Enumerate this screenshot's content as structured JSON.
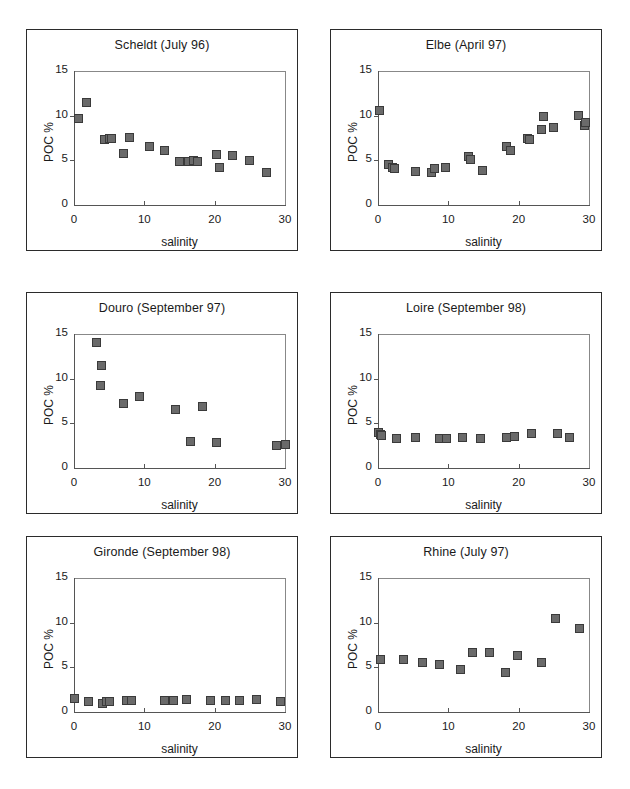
{
  "figure": {
    "width": 630,
    "height": 789,
    "background": "#ffffff",
    "marker_fill": "#6a6a6a",
    "marker_edge": "#3a3a3a",
    "axis_color": "#555555",
    "panel_border": "#2b2b2b"
  },
  "chart_data": [
    {
      "type": "scatter",
      "title": "Scheldt (July 96)",
      "xlabel": "salinity",
      "ylabel": "POC %",
      "xlim": [
        0,
        30
      ],
      "ylim": [
        0,
        15
      ],
      "xticks": [
        0,
        10,
        20,
        30
      ],
      "yticks": [
        0,
        5,
        10,
        15
      ],
      "grid": false,
      "legend": "none",
      "points": [
        {
          "x": 0.6,
          "y": 9.7
        },
        {
          "x": 1.8,
          "y": 11.5
        },
        {
          "x": 4.4,
          "y": 7.3
        },
        {
          "x": 5.0,
          "y": 7.4
        },
        {
          "x": 5.3,
          "y": 7.5
        },
        {
          "x": 7.0,
          "y": 5.8
        },
        {
          "x": 7.9,
          "y": 7.6
        },
        {
          "x": 10.7,
          "y": 6.5
        },
        {
          "x": 12.8,
          "y": 6.1
        },
        {
          "x": 15.0,
          "y": 4.9
        },
        {
          "x": 16.3,
          "y": 4.9
        },
        {
          "x": 17.0,
          "y": 5.0
        },
        {
          "x": 17.6,
          "y": 4.9
        },
        {
          "x": 20.3,
          "y": 5.7
        },
        {
          "x": 20.7,
          "y": 4.2
        },
        {
          "x": 22.5,
          "y": 5.5
        },
        {
          "x": 25.0,
          "y": 5.0
        },
        {
          "x": 27.4,
          "y": 3.6
        }
      ]
    },
    {
      "type": "scatter",
      "title": "Elbe (April 97)",
      "xlabel": "salinity",
      "ylabel": "POC %",
      "xlim": [
        0,
        30
      ],
      "ylim": [
        0,
        15
      ],
      "xticks": [
        0,
        10,
        20,
        30
      ],
      "yticks": [
        0,
        5,
        10,
        15
      ],
      "grid": false,
      "legend": "none",
      "points": [
        {
          "x": 0.2,
          "y": 10.6
        },
        {
          "x": 1.5,
          "y": 4.5
        },
        {
          "x": 2.0,
          "y": 4.2
        },
        {
          "x": 2.4,
          "y": 4.1
        },
        {
          "x": 5.4,
          "y": 3.8
        },
        {
          "x": 7.6,
          "y": 3.6
        },
        {
          "x": 8.0,
          "y": 4.1
        },
        {
          "x": 9.6,
          "y": 4.2
        },
        {
          "x": 12.8,
          "y": 5.4
        },
        {
          "x": 13.1,
          "y": 5.1
        },
        {
          "x": 14.9,
          "y": 3.9
        },
        {
          "x": 18.3,
          "y": 6.6
        },
        {
          "x": 18.9,
          "y": 6.1
        },
        {
          "x": 21.3,
          "y": 7.5
        },
        {
          "x": 21.6,
          "y": 7.3
        },
        {
          "x": 23.3,
          "y": 8.4
        },
        {
          "x": 23.6,
          "y": 9.9
        },
        {
          "x": 25.0,
          "y": 8.7
        },
        {
          "x": 28.5,
          "y": 10.0
        },
        {
          "x": 29.3,
          "y": 8.9
        },
        {
          "x": 29.5,
          "y": 9.2
        }
      ]
    },
    {
      "type": "scatter",
      "title": "Douro (September 97)",
      "xlabel": "salinity",
      "ylabel": "POC %",
      "xlim": [
        0,
        30
      ],
      "ylim": [
        0,
        15
      ],
      "xticks": [
        0,
        10,
        20,
        30
      ],
      "yticks": [
        0,
        5,
        10,
        15
      ],
      "grid": false,
      "legend": "none",
      "points": [
        {
          "x": 3.2,
          "y": 14.0
        },
        {
          "x": 3.9,
          "y": 11.5
        },
        {
          "x": 3.8,
          "y": 9.2
        },
        {
          "x": 7.0,
          "y": 7.2
        },
        {
          "x": 9.3,
          "y": 8.0
        },
        {
          "x": 14.5,
          "y": 6.6
        },
        {
          "x": 16.6,
          "y": 3.0
        },
        {
          "x": 18.3,
          "y": 6.9
        },
        {
          "x": 20.3,
          "y": 2.9
        },
        {
          "x": 28.8,
          "y": 2.5
        },
        {
          "x": 30.0,
          "y": 2.6
        }
      ]
    },
    {
      "type": "scatter",
      "title": "Loire (September 98)",
      "xlabel": "salinity",
      "ylabel": "POC %",
      "xlim": [
        0,
        30
      ],
      "ylim": [
        0,
        15
      ],
      "xticks": [
        0,
        10,
        20,
        30
      ],
      "yticks": [
        0,
        5,
        10,
        15
      ],
      "grid": false,
      "legend": "none",
      "points": [
        {
          "x": 0.0,
          "y": 4.0
        },
        {
          "x": 0.3,
          "y": 3.7
        },
        {
          "x": 0.5,
          "y": 3.6
        },
        {
          "x": 2.6,
          "y": 3.3
        },
        {
          "x": 5.4,
          "y": 3.4
        },
        {
          "x": 8.8,
          "y": 3.3
        },
        {
          "x": 9.8,
          "y": 3.3
        },
        {
          "x": 12.0,
          "y": 3.4
        },
        {
          "x": 14.6,
          "y": 3.3
        },
        {
          "x": 18.3,
          "y": 3.4
        },
        {
          "x": 19.4,
          "y": 3.5
        },
        {
          "x": 21.8,
          "y": 3.9
        },
        {
          "x": 25.5,
          "y": 3.9
        },
        {
          "x": 27.2,
          "y": 3.4
        }
      ]
    },
    {
      "type": "scatter",
      "title": "Gironde (September 98)",
      "xlabel": "salinity",
      "ylabel": "POC %",
      "xlim": [
        0,
        30
      ],
      "ylim": [
        0,
        15
      ],
      "xticks": [
        0,
        10,
        20,
        30
      ],
      "yticks": [
        0,
        5,
        10,
        15
      ],
      "grid": false,
      "legend": "none",
      "points": [
        {
          "x": 0.0,
          "y": 1.5
        },
        {
          "x": 2.0,
          "y": 1.2
        },
        {
          "x": 4.1,
          "y": 0.9
        },
        {
          "x": 4.6,
          "y": 1.2
        },
        {
          "x": 5.0,
          "y": 1.2
        },
        {
          "x": 7.5,
          "y": 1.3
        },
        {
          "x": 8.2,
          "y": 1.3
        },
        {
          "x": 12.8,
          "y": 1.3
        },
        {
          "x": 14.1,
          "y": 1.3
        },
        {
          "x": 16.0,
          "y": 1.4
        },
        {
          "x": 19.4,
          "y": 1.3
        },
        {
          "x": 21.5,
          "y": 1.3
        },
        {
          "x": 23.5,
          "y": 1.3
        },
        {
          "x": 25.9,
          "y": 1.4
        },
        {
          "x": 29.3,
          "y": 1.2
        }
      ]
    },
    {
      "type": "scatter",
      "title": "Rhine (July 97)",
      "xlabel": "salinity",
      "ylabel": "POC %",
      "xlim": [
        0,
        30
      ],
      "ylim": [
        0,
        15
      ],
      "xticks": [
        0,
        10,
        20,
        30
      ],
      "yticks": [
        0,
        5,
        10,
        15
      ],
      "grid": false,
      "legend": "none",
      "points": [
        {
          "x": 0.3,
          "y": 5.9
        },
        {
          "x": 3.6,
          "y": 5.9
        },
        {
          "x": 6.3,
          "y": 5.5
        },
        {
          "x": 8.7,
          "y": 5.3
        },
        {
          "x": 11.8,
          "y": 4.8
        },
        {
          "x": 13.5,
          "y": 6.7
        },
        {
          "x": 15.8,
          "y": 6.7
        },
        {
          "x": 18.1,
          "y": 4.4
        },
        {
          "x": 19.8,
          "y": 6.3
        },
        {
          "x": 23.3,
          "y": 5.5
        },
        {
          "x": 25.3,
          "y": 10.5
        },
        {
          "x": 28.6,
          "y": 9.4
        }
      ]
    }
  ],
  "panels": [
    {
      "name": "scheldt",
      "left": 26,
      "top": 29,
      "width": 272,
      "height": 222
    },
    {
      "name": "elbe",
      "left": 330,
      "top": 29,
      "width": 272,
      "height": 222
    },
    {
      "name": "douro",
      "left": 26,
      "top": 292,
      "width": 272,
      "height": 222
    },
    {
      "name": "loire",
      "left": 330,
      "top": 292,
      "width": 272,
      "height": 222
    },
    {
      "name": "gironde",
      "left": 26,
      "top": 536,
      "width": 272,
      "height": 222
    },
    {
      "name": "rhine",
      "left": 330,
      "top": 536,
      "width": 272,
      "height": 222
    }
  ],
  "plot_geometry": {
    "inset_left": 47,
    "inset_top": 41,
    "plot_width": 211,
    "plot_height": 134
  }
}
